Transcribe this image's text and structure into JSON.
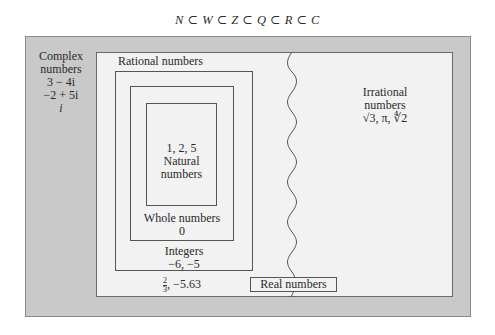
{
  "title": "N ⊂ W ⊂ Z ⊂ Q ⊂ R ⊂ C",
  "complex": {
    "label_1": "Complex",
    "label_2": "numbers",
    "examples": [
      "3 − 4i",
      "−2 + 5i",
      "i"
    ]
  },
  "irrational": {
    "label_1": "Irrational",
    "label_2": "numbers",
    "examples": "√3, π, ∜2"
  },
  "rational": {
    "label": "Rational numbers",
    "examples_frac_num": "2",
    "examples_frac_den": "3",
    "examples_rest": ", −5.63"
  },
  "integers": {
    "label": "Integers",
    "examples": "−6, −5"
  },
  "whole": {
    "label": "Whole numbers",
    "examples": "0"
  },
  "natural": {
    "examples": "1, 2, 5",
    "label_1": "Natural",
    "label_2": "numbers"
  },
  "real": {
    "label": "Real numbers"
  },
  "colors": {
    "complex_region": "#c9c9c9",
    "real_region": "#f2f2f2",
    "border": "#555555"
  }
}
